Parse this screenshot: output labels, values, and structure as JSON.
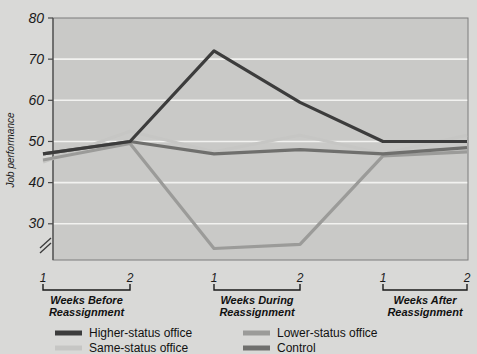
{
  "chart_data": {
    "type": "line",
    "title": "",
    "xlabel": "",
    "ylabel": "Job performance",
    "ylim": [
      20,
      80
    ],
    "yticks": [
      30,
      40,
      50,
      60,
      70,
      80
    ],
    "ytick_labels": [
      "30",
      "40",
      "50",
      "60",
      "70",
      "80"
    ],
    "axis_break": true,
    "grid": true,
    "legend_position": "bottom",
    "x": [
      "1",
      "2",
      "1",
      "2",
      "1",
      "2"
    ],
    "xtick_labels": [
      "1",
      "2",
      "1",
      "2",
      "1",
      "2"
    ],
    "groups": [
      {
        "label_line1": "Weeks Before",
        "label_line2": "Reassignment",
        "ticks": [
          "1",
          "2"
        ]
      },
      {
        "label_line1": "Weeks During",
        "label_line2": "Reassignment",
        "ticks": [
          "1",
          "2"
        ]
      },
      {
        "label_line1": "Weeks After",
        "label_line2": "Reassignment",
        "ticks": [
          "1",
          "2"
        ]
      }
    ],
    "series": [
      {
        "name": "Higher-status office",
        "color": "#3c3c3c",
        "values": [
          47,
          50,
          72,
          59.5,
          50,
          50
        ]
      },
      {
        "name": "Same-status office",
        "color": "#c6c6c4",
        "values": [
          45,
          52.5,
          47.5,
          51.5,
          47,
          51.5
        ]
      },
      {
        "name": "Lower-status office",
        "color": "#9b9b99",
        "values": [
          45.5,
          49.5,
          24,
          25,
          46.5,
          47.5
        ]
      },
      {
        "name": "Control",
        "color": "#6f6f6d",
        "values": [
          47,
          50,
          47,
          48,
          47,
          48.5
        ]
      }
    ]
  },
  "legend": {
    "items": [
      {
        "label": "Higher-status office",
        "color": "#3c3c3c"
      },
      {
        "label": "Lower-status office",
        "color": "#9b9b99"
      },
      {
        "label": "Same-status office",
        "color": "#c6c6c4"
      },
      {
        "label": "Control",
        "color": "#6f6f6d"
      }
    ]
  },
  "colors": {
    "background": "#d9d9d7",
    "plot_area": "#c9c9c7",
    "gridline": "#f2f2f0",
    "text": "#1a1a1a"
  }
}
